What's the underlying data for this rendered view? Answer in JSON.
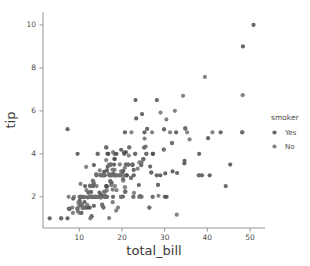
{
  "figure": {
    "background_color": "#ffffff",
    "plot_area": {
      "left": 43,
      "right": 265,
      "top": 12,
      "bottom": 228
    }
  },
  "chart_data": {
    "type": "scatter",
    "title": "",
    "xlabel": "total_bill",
    "ylabel": "tip",
    "xlim": [
      1.5,
      53.5
    ],
    "ylim": [
      0.55,
      10.6
    ],
    "xticks": [
      10,
      20,
      30,
      40,
      50
    ],
    "yticks": [
      2,
      4,
      6,
      8,
      10
    ],
    "grid": false,
    "legend": {
      "title": "smoker",
      "position": "right-outside",
      "entries": [
        {
          "label": "Yes",
          "color": "#4c4c4c"
        },
        {
          "label": "No",
          "color": "#6f6f6f"
        }
      ]
    },
    "marker": {
      "shape": "circle",
      "size": 2.1,
      "opacity": 0.85
    },
    "series": [
      {
        "name": "Yes",
        "color": "#4c4c4c",
        "points": [
          [
            38.01,
            3.0
          ],
          [
            11.24,
            1.76
          ],
          [
            20.29,
            3.21
          ],
          [
            13.81,
            2.0
          ],
          [
            11.02,
            1.98
          ],
          [
            18.29,
            3.76
          ],
          [
            17.59,
            2.64
          ],
          [
            20.08,
            3.15
          ],
          [
            16.45,
            2.47
          ],
          [
            3.07,
            1.0
          ],
          [
            20.23,
            2.01
          ],
          [
            15.01,
            2.09
          ],
          [
            12.02,
            1.97
          ],
          [
            17.07,
            3.0
          ],
          [
            26.86,
            3.14
          ],
          [
            25.28,
            5.0
          ],
          [
            14.73,
            2.2
          ],
          [
            10.51,
            1.25
          ],
          [
            17.92,
            3.08
          ],
          [
            27.2,
            4.0
          ],
          [
            22.76,
            3.0
          ],
          [
            17.29,
            2.71
          ],
          [
            19.44,
            3.0
          ],
          [
            16.66,
            3.4
          ],
          [
            10.07,
            1.83
          ],
          [
            32.68,
            5.0
          ],
          [
            15.98,
            2.03
          ],
          [
            34.83,
            5.17
          ],
          [
            13.03,
            2.0
          ],
          [
            18.28,
            4.0
          ],
          [
            24.71,
            5.85
          ],
          [
            21.16,
            3.0
          ],
          [
            28.97,
            3.0
          ],
          [
            22.49,
            3.5
          ],
          [
            5.75,
            1.0
          ],
          [
            16.32,
            4.3
          ],
          [
            22.75,
            3.25
          ],
          [
            40.17,
            4.73
          ],
          [
            27.28,
            4.0
          ],
          [
            12.03,
            1.5
          ],
          [
            21.01,
            3.0
          ],
          [
            12.46,
            1.5
          ],
          [
            11.35,
            2.5
          ],
          [
            15.38,
            3.0
          ],
          [
            44.3,
            2.5
          ],
          [
            22.42,
            3.48
          ],
          [
            20.92,
            4.08
          ],
          [
            15.36,
            1.64
          ],
          [
            20.49,
            4.06
          ],
          [
            25.21,
            4.29
          ],
          [
            18.24,
            3.76
          ],
          [
            14.31,
            4.0
          ],
          [
            14.0,
            3.0
          ],
          [
            7.25,
            1.0
          ],
          [
            38.07,
            4.0
          ],
          [
            23.95,
            2.55
          ],
          [
            25.71,
            4.0
          ],
          [
            17.31,
            3.5
          ],
          [
            29.85,
            5.14
          ],
          [
            48.17,
            5.0
          ],
          [
            25.0,
            3.75
          ],
          [
            13.39,
            2.61
          ],
          [
            16.49,
            2.0
          ],
          [
            21.5,
            3.5
          ],
          [
            12.66,
            2.5
          ],
          [
            16.21,
            2.0
          ],
          [
            13.81,
            2.0
          ],
          [
            17.51,
            3.0
          ],
          [
            24.52,
            3.48
          ],
          [
            20.76,
            2.24
          ],
          [
            31.71,
            4.5
          ],
          [
            10.59,
            1.61
          ],
          [
            10.63,
            2.0
          ],
          [
            50.81,
            10.0
          ],
          [
            15.81,
            3.16
          ],
          [
            7.25,
            5.15
          ],
          [
            31.85,
            3.18
          ],
          [
            16.82,
            4.0
          ],
          [
            32.9,
            3.11
          ],
          [
            17.89,
            2.0
          ],
          [
            14.48,
            2.0
          ],
          [
            9.6,
            4.0
          ],
          [
            34.63,
            3.55
          ],
          [
            34.65,
            3.68
          ],
          [
            23.33,
            5.65
          ],
          [
            45.35,
            3.5
          ],
          [
            23.17,
            6.5
          ],
          [
            40.55,
            3.0
          ],
          [
            20.69,
            5.0
          ],
          [
            20.9,
            3.5
          ],
          [
            30.46,
            2.0
          ],
          [
            18.15,
            3.5
          ],
          [
            23.1,
            4.0
          ],
          [
            15.69,
            1.5
          ],
          [
            19.81,
            4.19
          ],
          [
            28.44,
            2.56
          ],
          [
            15.48,
            2.02
          ],
          [
            16.58,
            4.0
          ],
          [
            7.56,
            1.44
          ],
          [
            10.34,
            2.0
          ],
          [
            43.11,
            5.0
          ],
          [
            13.0,
            2.0
          ],
          [
            13.51,
            2.0
          ],
          [
            18.71,
            4.0
          ],
          [
            12.74,
            2.01
          ],
          [
            13.0,
            2.0
          ],
          [
            16.4,
            2.5
          ],
          [
            20.53,
            4.0
          ],
          [
            16.47,
            3.23
          ],
          [
            26.59,
            3.41
          ],
          [
            38.73,
            3.0
          ],
          [
            24.27,
            2.03
          ],
          [
            12.76,
            2.23
          ],
          [
            30.06,
            2.0
          ],
          [
            25.89,
            5.16
          ],
          [
            48.33,
            9.0
          ],
          [
            13.27,
            2.5
          ],
          [
            28.17,
            6.5
          ],
          [
            12.9,
            1.1
          ],
          [
            28.15,
            3.0
          ],
          [
            11.59,
            1.5
          ],
          [
            7.74,
            1.44
          ],
          [
            30.14,
            3.09
          ],
          [
            12.16,
            2.2
          ],
          [
            13.42,
            3.48
          ],
          [
            8.58,
            1.92
          ],
          [
            15.98,
            3.0
          ],
          [
            13.42,
            1.58
          ],
          [
            16.27,
            2.5
          ],
          [
            10.09,
            2.0
          ]
        ]
      },
      {
        "name": "No",
        "color": "#6f6f6f",
        "points": [
          [
            16.99,
            1.01
          ],
          [
            10.34,
            1.66
          ],
          [
            21.01,
            3.5
          ],
          [
            23.68,
            3.31
          ],
          [
            24.59,
            3.61
          ],
          [
            25.29,
            4.71
          ],
          [
            8.77,
            2.0
          ],
          [
            26.88,
            3.12
          ],
          [
            15.04,
            1.96
          ],
          [
            14.78,
            3.23
          ],
          [
            10.27,
            1.71
          ],
          [
            35.26,
            5.0
          ],
          [
            15.42,
            1.57
          ],
          [
            18.43,
            3.0
          ],
          [
            14.83,
            3.02
          ],
          [
            21.58,
            3.92
          ],
          [
            10.33,
            1.67
          ],
          [
            16.29,
            3.71
          ],
          [
            16.97,
            3.5
          ],
          [
            20.65,
            3.35
          ],
          [
            17.92,
            4.08
          ],
          [
            20.29,
            2.75
          ],
          [
            15.77,
            2.23
          ],
          [
            39.42,
            7.58
          ],
          [
            19.82,
            3.18
          ],
          [
            17.81,
            2.34
          ],
          [
            13.37,
            2.0
          ],
          [
            12.69,
            2.0
          ],
          [
            21.7,
            4.3
          ],
          [
            9.55,
            1.45
          ],
          [
            18.35,
            2.5
          ],
          [
            15.06,
            3.0
          ],
          [
            20.69,
            2.45
          ],
          [
            17.78,
            3.27
          ],
          [
            24.06,
            3.6
          ],
          [
            16.31,
            2.0
          ],
          [
            16.93,
            3.07
          ],
          [
            18.69,
            2.31
          ],
          [
            31.27,
            5.0
          ],
          [
            16.04,
            2.24
          ],
          [
            17.46,
            2.54
          ],
          [
            13.94,
            3.06
          ],
          [
            9.68,
            1.32
          ],
          [
            30.4,
            5.6
          ],
          [
            18.29,
            3.0
          ],
          [
            22.23,
            5.0
          ],
          [
            32.4,
            6.0
          ],
          [
            28.55,
            2.05
          ],
          [
            18.04,
            3.0
          ],
          [
            12.54,
            2.5
          ],
          [
            10.29,
            2.6
          ],
          [
            34.81,
            5.2
          ],
          [
            9.94,
            1.56
          ],
          [
            25.56,
            4.34
          ],
          [
            19.49,
            3.51
          ],
          [
            38.01,
            3.0
          ],
          [
            26.41,
            1.5
          ],
          [
            11.17,
            1.5
          ],
          [
            48.27,
            6.73
          ],
          [
            20.76,
            2.24
          ],
          [
            20.27,
            2.83
          ],
          [
            11.69,
            2.31
          ],
          [
            13.81,
            2.0
          ],
          [
            22.12,
            2.88
          ],
          [
            24.01,
            2.0
          ],
          [
            15.69,
            3.0
          ],
          [
            11.61,
            3.39
          ],
          [
            10.77,
            1.47
          ],
          [
            15.53,
            3.0
          ],
          [
            10.07,
            1.25
          ],
          [
            12.6,
            1.0
          ],
          [
            32.83,
            1.17
          ],
          [
            35.83,
            4.67
          ],
          [
            29.03,
            5.92
          ],
          [
            27.18,
            2.0
          ],
          [
            22.67,
            2.0
          ],
          [
            17.82,
            1.75
          ],
          [
            18.78,
            3.0
          ],
          [
            20.45,
            3.0
          ],
          [
            13.28,
            2.72
          ],
          [
            22.12,
            2.88
          ],
          [
            19.65,
            3.0
          ],
          [
            16.31,
            2.0
          ],
          [
            24.55,
            2.0
          ],
          [
            19.77,
            2.0
          ],
          [
            29.8,
            4.2
          ],
          [
            26.41,
            1.5
          ],
          [
            12.48,
            2.52
          ],
          [
            29.8,
            4.2
          ],
          [
            14.52,
            2.0
          ],
          [
            11.38,
            2.0
          ],
          [
            22.82,
            2.18
          ],
          [
            19.08,
            1.5
          ],
          [
            20.27,
            2.83
          ],
          [
            11.17,
            1.5
          ],
          [
            12.26,
            2.0
          ],
          [
            18.26,
            3.25
          ],
          [
            8.51,
            1.25
          ],
          [
            10.33,
            2.0
          ],
          [
            14.15,
            2.0
          ],
          [
            16.0,
            2.0
          ],
          [
            13.16,
            2.75
          ],
          [
            17.47,
            3.5
          ],
          [
            34.3,
            6.7
          ],
          [
            41.19,
            5.0
          ],
          [
            27.05,
            5.0
          ],
          [
            16.43,
            2.3
          ],
          [
            8.35,
            1.5
          ],
          [
            18.64,
            1.36
          ],
          [
            11.87,
            1.63
          ],
          [
            9.78,
            1.73
          ],
          [
            7.51,
            2.0
          ],
          [
            14.07,
            2.5
          ],
          [
            13.13,
            2.0
          ],
          [
            17.26,
            2.74
          ],
          [
            24.55,
            2.0
          ],
          [
            19.77,
            2.0
          ],
          [
            29.85,
            5.14
          ],
          [
            48.17,
            5.0
          ],
          [
            25.0,
            3.75
          ],
          [
            13.39,
            2.61
          ],
          [
            16.49,
            2.0
          ],
          [
            21.5,
            3.5
          ],
          [
            12.66,
            2.5
          ],
          [
            16.21,
            2.0
          ],
          [
            13.81,
            2.0
          ],
          [
            17.51,
            3.0
          ],
          [
            24.52,
            3.48
          ],
          [
            20.76,
            2.24
          ],
          [
            31.71,
            4.5
          ],
          [
            10.59,
            1.61
          ],
          [
            10.63,
            2.0
          ],
          [
            18.78,
            3.0
          ],
          [
            15.95,
            2.0
          ],
          [
            7.56,
            1.44
          ],
          [
            22.49,
            3.5
          ],
          [
            5.75,
            1.0
          ],
          [
            16.32,
            4.3
          ],
          [
            21.7,
            4.3
          ],
          [
            9.55,
            1.45
          ],
          [
            28.44,
            2.56
          ],
          [
            12.16,
            2.2
          ],
          [
            25.71,
            4.0
          ],
          [
            17.31,
            3.5
          ],
          [
            15.98,
            2.03
          ],
          [
            25.21,
            4.29
          ],
          [
            14.31,
            4.0
          ],
          [
            23.1,
            4.0
          ],
          [
            27.18,
            2.0
          ],
          [
            22.67,
            2.0
          ]
        ]
      }
    ]
  },
  "axes": {
    "x_tick_labels": [
      "10",
      "20",
      "30",
      "40",
      "50"
    ],
    "y_tick_labels": [
      "2",
      "4",
      "6",
      "8",
      "10"
    ],
    "x_axis_title": "total_bill",
    "y_axis_title": "tip"
  },
  "legend": {
    "title": "smoker",
    "items": [
      {
        "label": "Yes"
      },
      {
        "label": "No"
      }
    ]
  }
}
